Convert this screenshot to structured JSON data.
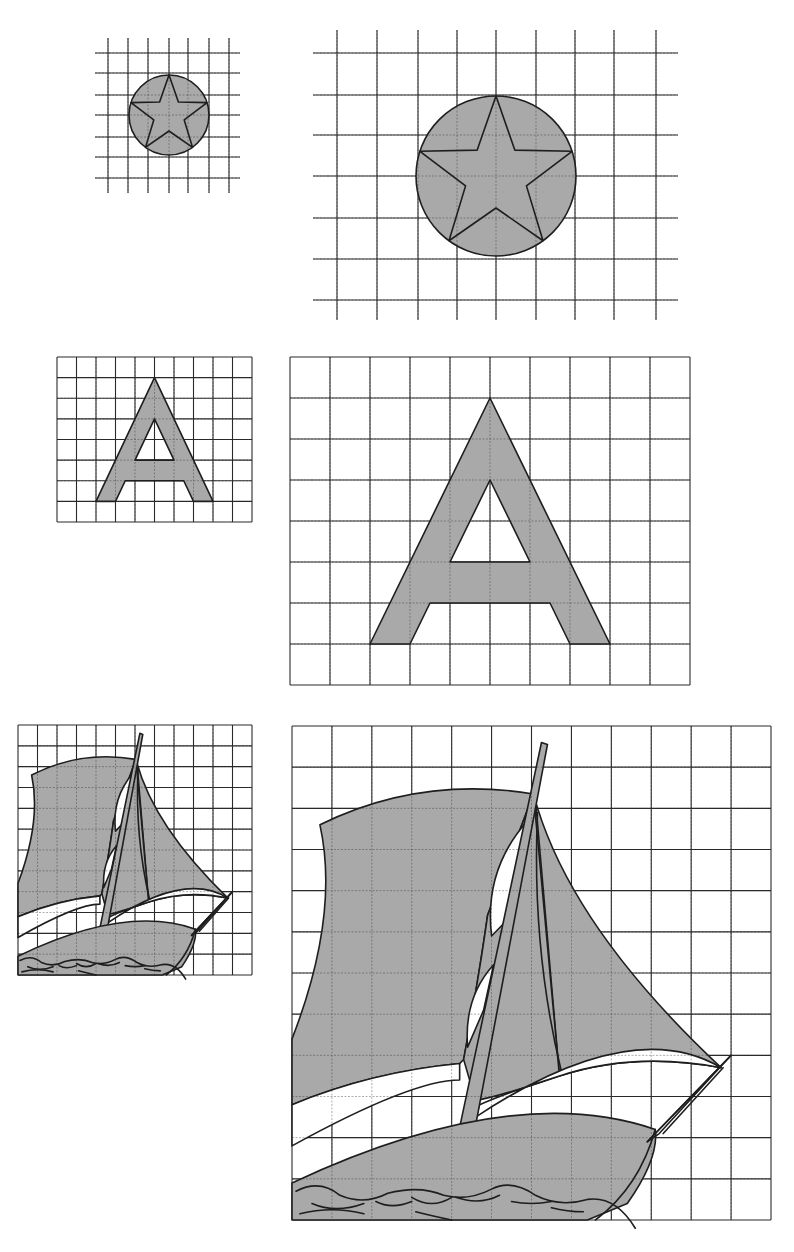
{
  "page": {
    "colors": {
      "fill": "#a9a9a9",
      "line": "#1e1e1e",
      "grid": "#2a2a2a",
      "background": "#ffffff"
    }
  },
  "figures": [
    {
      "id": "star-small",
      "name": "star-in-circle-small-grid",
      "x": 90,
      "y": 38,
      "w": 150,
      "h": 155,
      "grid": {
        "cols_x": [
          18,
          38,
          58,
          79,
          98,
          119,
          139
        ],
        "rows_y": [
          15,
          35,
          57,
          77,
          99,
          119,
          140
        ],
        "extend": {
          "x0": 5,
          "x1": 150,
          "y0": 0,
          "y1": 155
        }
      },
      "shape": "star",
      "cx": 79,
      "cy": 77,
      "r": 40
    },
    {
      "id": "star-large",
      "name": "star-in-circle-large-grid",
      "x": 313,
      "y": 30,
      "w": 365,
      "h": 290,
      "grid": {
        "cols_x": [
          24,
          64,
          105,
          144,
          183,
          223,
          262,
          301,
          343
        ],
        "rows_y": [
          23,
          65,
          105,
          146,
          188,
          229,
          270
        ],
        "extend": {
          "x0": 0,
          "x1": 365,
          "y0": 0,
          "y1": 290
        }
      },
      "shape": "star",
      "cx": 183,
      "cy": 146,
      "r": 80
    },
    {
      "id": "letter-a-small",
      "name": "letter-a-small-grid",
      "x": 57,
      "y": 357,
      "w": 195,
      "h": 165,
      "grid": {
        "cols": 10,
        "rows": 8,
        "boxed": true
      },
      "shape": "letterA"
    },
    {
      "id": "letter-a-large",
      "name": "letter-a-large-grid",
      "x": 290,
      "y": 357,
      "w": 400,
      "h": 328,
      "grid": {
        "cols": 10,
        "rows": 8,
        "boxed": true
      },
      "shape": "letterA"
    },
    {
      "id": "sailboat-small",
      "name": "sailboat-small-grid",
      "x": 18,
      "y": 725,
      "w": 234,
      "h": 250,
      "grid": {
        "cols": 12,
        "rows": 12,
        "boxed": true
      },
      "shape": "sailboat"
    },
    {
      "id": "sailboat-large",
      "name": "sailboat-large-grid",
      "x": 292,
      "y": 726,
      "w": 479,
      "h": 494,
      "grid": {
        "cols": 12,
        "rows": 12,
        "boxed": true
      },
      "shape": "sailboat"
    }
  ]
}
